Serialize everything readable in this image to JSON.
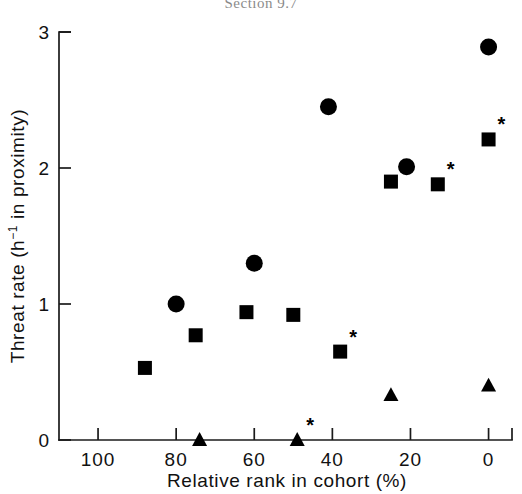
{
  "caption": {
    "text": "Section 9.7"
  },
  "chart_data": {
    "type": "scatter",
    "title": "",
    "xlabel": "Relative rank in cohort (%)",
    "ylabel": "Threat rate (h⁻¹ in proximity)",
    "ylabel_parts": {
      "prefix": "Threat rate (h",
      "superscript": "−1",
      "suffix": " in proximity)"
    },
    "xlim": [
      110,
      -6
    ],
    "ylim": [
      0,
      3
    ],
    "x_reversed": true,
    "grid": false,
    "legend": null,
    "xticks": [
      100,
      80,
      60,
      40,
      20,
      0
    ],
    "xtick_labels": [
      "100",
      "80",
      "60",
      "40",
      "20",
      "0"
    ],
    "yticks": [
      0,
      1,
      2,
      3
    ],
    "ytick_labels": [
      "0",
      "1",
      "2",
      "3"
    ],
    "marker_shapes": [
      "circle",
      "square",
      "triangle"
    ],
    "annotation_symbol": "*",
    "series": [
      {
        "name": "circle",
        "marker": "circle",
        "points": [
          {
            "x": 80,
            "y": 1.0,
            "star": false
          },
          {
            "x": 60,
            "y": 1.3,
            "star": false
          },
          {
            "x": 41,
            "y": 2.45,
            "star": false
          },
          {
            "x": 21,
            "y": 2.01,
            "star": false
          },
          {
            "x": 0,
            "y": 2.89,
            "star": false
          }
        ]
      },
      {
        "name": "square",
        "marker": "square",
        "points": [
          {
            "x": 88,
            "y": 0.53,
            "star": false
          },
          {
            "x": 75,
            "y": 0.77,
            "star": false
          },
          {
            "x": 62,
            "y": 0.94,
            "star": false
          },
          {
            "x": 50,
            "y": 0.92,
            "star": false
          },
          {
            "x": 38,
            "y": 0.65,
            "star": true
          },
          {
            "x": 25,
            "y": 1.9,
            "star": false
          },
          {
            "x": 13,
            "y": 1.88,
            "star": true
          },
          {
            "x": 0,
            "y": 2.21,
            "star": true
          }
        ]
      },
      {
        "name": "triangle",
        "marker": "triangle",
        "points": [
          {
            "x": 74,
            "y": 0.0,
            "star": false
          },
          {
            "x": 49,
            "y": 0.0,
            "star": true
          },
          {
            "x": 25,
            "y": 0.33,
            "star": false
          },
          {
            "x": 0,
            "y": 0.4,
            "star": false
          }
        ]
      }
    ]
  }
}
